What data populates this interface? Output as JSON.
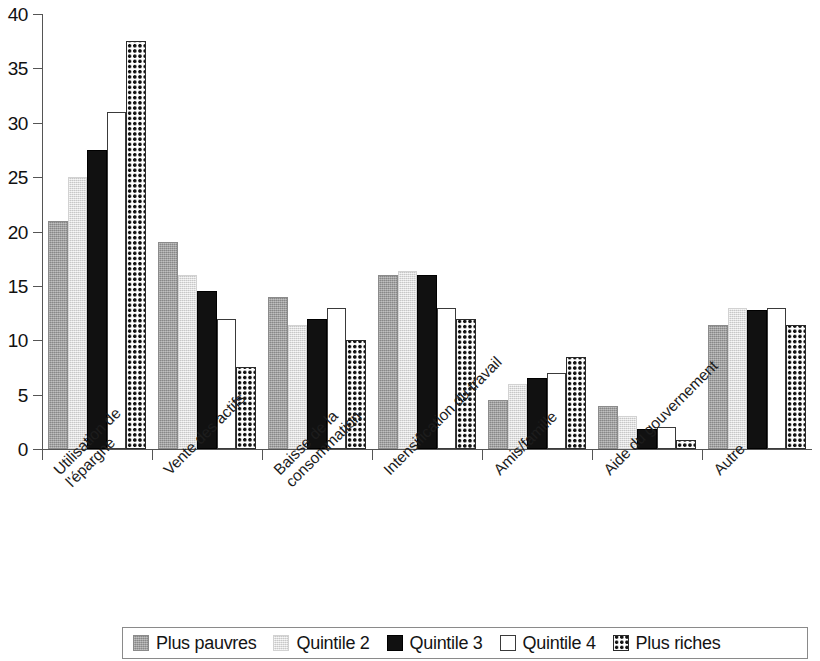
{
  "chart_data": {
    "type": "bar",
    "title": "",
    "subtitle": "",
    "xlabel": "",
    "ylabel": "",
    "ylim": [
      0,
      40
    ],
    "yticks": [
      0,
      5,
      10,
      15,
      20,
      25,
      30,
      35,
      40
    ],
    "grid": false,
    "legend_position": "bottom",
    "categories": [
      "Utilisation de\nl'épargne",
      "Vente des actifs",
      "Baisse de la\nconsommation",
      "Intensification du travail",
      "Amis/famille",
      "Aide du gouvernement",
      "Autre"
    ],
    "series": [
      {
        "name": "Plus pauvres",
        "pattern": "solid-medium-gray",
        "color": "#9d9d9d",
        "values": [
          21.0,
          19.0,
          14.0,
          16.0,
          4.5,
          4.0,
          11.4
        ]
      },
      {
        "name": "Quintile 2",
        "pattern": "solid-light-gray",
        "color": "#e2e2e2",
        "values": [
          25.0,
          16.0,
          11.4,
          16.4,
          6.0,
          3.0,
          13.0
        ]
      },
      {
        "name": "Quintile 3",
        "pattern": "solid-black",
        "color": "#111111",
        "values": [
          27.5,
          14.5,
          12.0,
          16.0,
          6.5,
          1.8,
          12.8
        ]
      },
      {
        "name": "Quintile 4",
        "pattern": "outline-white",
        "color": "#ffffff",
        "values": [
          31.0,
          12.0,
          13.0,
          13.0,
          7.0,
          2.0,
          13.0
        ]
      },
      {
        "name": "Plus riches",
        "pattern": "dotted-checker",
        "color": "#ffffff",
        "values": [
          37.5,
          7.5,
          10.0,
          12.0,
          8.5,
          0.8,
          11.4
        ]
      }
    ]
  },
  "legend": {
    "items": [
      {
        "label": "Plus pauvres"
      },
      {
        "label": "Quintile 2"
      },
      {
        "label": "Quintile 3"
      },
      {
        "label": "Quintile 4"
      },
      {
        "label": "Plus riches"
      }
    ]
  }
}
